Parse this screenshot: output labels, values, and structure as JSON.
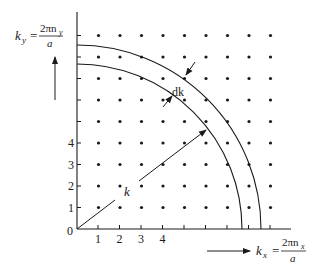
{
  "diagram": {
    "y_axis_label": {
      "lhs": "k",
      "lhs_sub": "y",
      "equals": "=",
      "numerator": "2πn",
      "numerator_sub": "y",
      "denominator": "a"
    },
    "x_axis_label": {
      "lhs": "k",
      "lhs_sub": "x",
      "equals": "=",
      "numerator": "2πn",
      "numerator_sub": "x",
      "denominator": "a"
    },
    "origin_label": "0",
    "x_tick_labels": [
      "1",
      "2",
      "3",
      "4"
    ],
    "y_tick_labels": [
      "1",
      "2",
      "3",
      "4"
    ],
    "vector_label": "k",
    "shell_label": "dk",
    "grid": {
      "columns": 9,
      "rows": 9
    },
    "colors": {
      "ink": "#1a1a1a",
      "background": "#ffffff"
    }
  }
}
